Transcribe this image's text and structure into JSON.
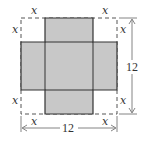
{
  "diagram": {
    "type": "box-net-cutout",
    "square_side_label": "12",
    "corner_cut_label": "x",
    "labels": {
      "top_left_horizontal": "x",
      "top_left_vertical": "x",
      "top_right_horizontal": "x",
      "top_right_vertical": "x",
      "bottom_left_vertical": "x",
      "bottom_left_horizontal": "x",
      "bottom_right_vertical": "x",
      "bottom_right_horizontal": "x",
      "width_dimension": "12",
      "height_dimension": "12"
    },
    "colors": {
      "fill": "#c8c8c8",
      "outline": "#333333",
      "dashed": "#555555",
      "dimension": "#666666"
    }
  }
}
